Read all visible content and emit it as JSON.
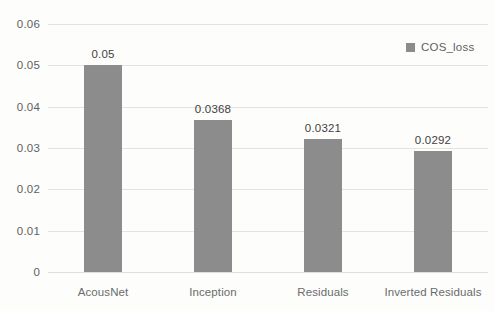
{
  "chart_data": {
    "type": "bar",
    "title": "",
    "xlabel": "",
    "ylabel": "",
    "categories": [
      "AcousNet",
      "Inception",
      "Residuals",
      "Inverted Residuals"
    ],
    "series": [
      {
        "name": "COS_loss",
        "values": [
          0.05,
          0.0368,
          0.0321,
          0.0292
        ],
        "value_labels": [
          "0.05",
          "0.0368",
          "0.0321",
          "0.0292"
        ],
        "color": "#8C8C8C"
      }
    ],
    "ylim": [
      0,
      0.06
    ],
    "ytick_values": [
      0.06,
      0.05,
      0.04,
      0.03,
      0.02,
      0.01,
      0
    ],
    "ytick_labels": [
      "0.06",
      "0.05",
      "0.04",
      "0.03",
      "0.02",
      "0.01",
      "0"
    ],
    "grid": true,
    "grid_axis": "y",
    "legend_position": "top-right",
    "background_color": "#FDFDFC",
    "gridline_color": "#E3E4E2",
    "tick_label_color": "#5F6160",
    "data_label_color": "#3F4140"
  },
  "legend": {
    "entries": [
      {
        "label": "COS_loss",
        "swatch_name": "legend-swatch-cos-loss"
      }
    ]
  },
  "yaxis": {
    "ticks": [
      {
        "label": "0.06",
        "value": 0.06
      },
      {
        "label": "0.05",
        "value": 0.05
      },
      {
        "label": "0.04",
        "value": 0.04
      },
      {
        "label": "0.03",
        "value": 0.03
      },
      {
        "label": "0.02",
        "value": 0.02
      },
      {
        "label": "0.01",
        "value": 0.01
      },
      {
        "label": "0",
        "value": 0
      }
    ]
  },
  "bars": [
    {
      "category": "AcousNet",
      "value": 0.05,
      "label": "0.05"
    },
    {
      "category": "Inception",
      "value": 0.0368,
      "label": "0.0368"
    },
    {
      "category": "Residuals",
      "value": 0.0321,
      "label": "0.0321"
    },
    {
      "category": "Inverted Residuals",
      "value": 0.0292,
      "label": "0.0292"
    }
  ]
}
